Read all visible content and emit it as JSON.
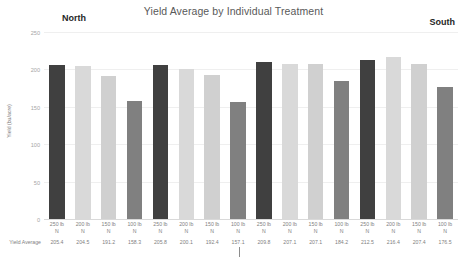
{
  "chart_data": {
    "type": "bar",
    "title": "Yield Average by Individual Treatment",
    "xlabel": "",
    "ylabel": "Yield (bu/acre)",
    "ylim": [
      0,
      250
    ],
    "yticks": [
      250,
      200,
      150,
      100,
      50,
      0
    ],
    "grid": true,
    "legend": "none",
    "categories": [
      "250 lb N",
      "200 lb N",
      "150 lb N",
      "100 lb N",
      "250 lb N",
      "200 lb N",
      "150 lb N",
      "100 lb N",
      "250 lb N",
      "200 lb N",
      "150 lb N",
      "100 lb N",
      "250 lb N",
      "200 lb N",
      "150 lb N",
      "100 lb N"
    ],
    "values": [
      205.4,
      204.5,
      191.2,
      158.3,
      205.8,
      200.1,
      192.4,
      157.1,
      209.8,
      207.1,
      207.1,
      184.2,
      212.5,
      216.4,
      207.4,
      176.5
    ],
    "bar_colors": [
      "#404040",
      "#d9d9d9",
      "#d0d0d0",
      "#808080",
      "#404040",
      "#d9d9d9",
      "#d0d0d0",
      "#808080",
      "#404040",
      "#d9d9d9",
      "#d0d0d0",
      "#808080",
      "#404040",
      "#d9d9d9",
      "#d0d0d0",
      "#808080"
    ],
    "data_row_label": "Yield Average",
    "annotations": [
      {
        "text": "North",
        "position": "top-left"
      },
      {
        "text": "South",
        "position": "top-right"
      }
    ]
  },
  "colors": {
    "dark_bar": "#404040",
    "light_bar": "#d9d9d9",
    "light_bar_alt": "#d0d0d0",
    "medium_bar": "#808080",
    "title_text": "#595959",
    "axis_text": "#a6a6a6",
    "label_text": "#7f7f7f",
    "region_text": "#262626",
    "gridline": "#efefef"
  },
  "annotations": {
    "north": "North",
    "south": "South"
  }
}
